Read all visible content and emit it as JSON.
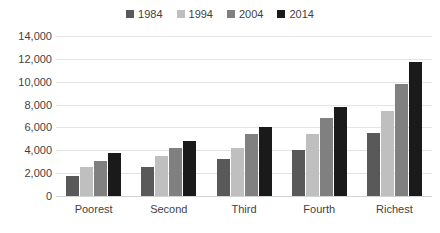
{
  "chart_data": {
    "type": "bar",
    "title": "",
    "subtitle": "",
    "xlabel": "",
    "ylabel": "",
    "categories": [
      "Poorest",
      "Second",
      "Third",
      "Fourth",
      "Richest"
    ],
    "series": [
      {
        "name": "1984",
        "color": "#595959",
        "values": [
          1750,
          2500,
          3200,
          4000,
          5500
        ]
      },
      {
        "name": "1994",
        "color": "#bfbfbf",
        "values": [
          2500,
          3500,
          4200,
          5400,
          7400
        ]
      },
      {
        "name": "2004",
        "color": "#808080",
        "values": [
          3100,
          4200,
          5400,
          6800,
          9800
        ]
      },
      {
        "name": "2014",
        "color": "#1a1a1a",
        "values": [
          3800,
          4800,
          6050,
          7800,
          11700
        ]
      }
    ],
    "ylim": [
      0,
      14000
    ],
    "ytick_labels": [
      "14,000",
      "12,000",
      "10,000",
      "8,000",
      "6,000",
      "4,000",
      "2,000",
      "0"
    ],
    "ytick_values": [
      14000,
      12000,
      10000,
      8000,
      6000,
      4000,
      2000,
      0
    ],
    "grid": true,
    "legend_position": "top"
  },
  "style": {
    "background": "#ffffff",
    "gridline_color": "#e4e4e4",
    "baseline_color": "#d2d2d2",
    "text_color": "#3f3f3f"
  }
}
